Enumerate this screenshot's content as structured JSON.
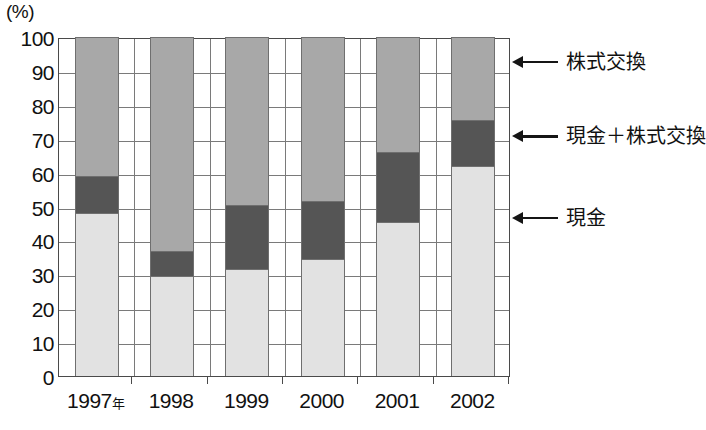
{
  "chart_data": {
    "type": "bar",
    "subtype": "stacked-percentage-column",
    "title": "",
    "xlabel": "",
    "ylabel": "(%)",
    "ylim": [
      0,
      100
    ],
    "y_ticks": [
      0,
      10,
      20,
      30,
      40,
      50,
      60,
      70,
      80,
      90,
      100
    ],
    "y_tick_labels": [
      "0",
      "10",
      "20",
      "30",
      "40",
      "50",
      "60",
      "70",
      "80",
      "90",
      "100"
    ],
    "grid": true,
    "legend_position": "right-annotations",
    "categories": [
      "1997年",
      "1998",
      "1999",
      "2000",
      "2001",
      "2002"
    ],
    "category_labels_main": [
      "1997",
      "1998",
      "1999",
      "2000",
      "2001",
      "2002"
    ],
    "category_label_suffix": "年",
    "series": [
      {
        "name": "現金",
        "color": "#e2e2e2",
        "values": [
          48,
          29.5,
          31.5,
          34.5,
          45.5,
          62
        ]
      },
      {
        "name": "現金＋株式交換",
        "color": "#555555",
        "values": [
          11,
          7.5,
          19,
          17,
          20.5,
          13.5
        ]
      },
      {
        "name": "株式交換",
        "color": "#a8a8a8",
        "values": [
          41,
          63,
          49.5,
          48.5,
          34,
          24.5
        ]
      }
    ]
  },
  "axis": {
    "unit_label": "(%)"
  },
  "annotations": [
    {
      "name": "stock-exchange",
      "label": "株式交換",
      "value_percent": 93
    },
    {
      "name": "cash-plus-stock",
      "label": "現金＋株式交換",
      "value_percent": 71
    },
    {
      "name": "cash",
      "label": "現金",
      "value_percent": 47
    }
  ],
  "colors": {
    "cash": "#e2e2e2",
    "cash_plus_stock": "#555555",
    "stock_exchange": "#a8a8a8",
    "axis": "#4a4a4a",
    "grid": "#7a7a7a",
    "text": "#111111"
  }
}
